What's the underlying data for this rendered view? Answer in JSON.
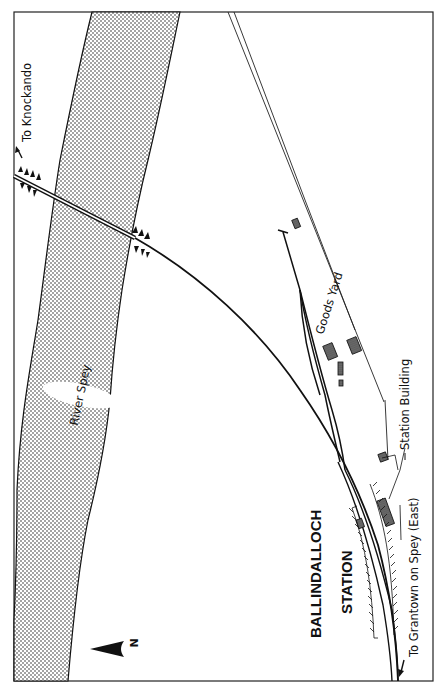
{
  "map": {
    "title_line1": "BALLINDALLOCH",
    "title_line2": "STATION",
    "labels": {
      "river": "River Spey",
      "goods_yard": "Goods Yard",
      "station_building": "Station Building",
      "to_north": "To Knockando",
      "to_south": "To Grantown on Spey (East)"
    },
    "north_indicator": "N",
    "colors": {
      "ink": "#111111",
      "paper": "#ffffff",
      "river_stipple": "#1a1a1a",
      "building_fill": "#555555"
    }
  }
}
